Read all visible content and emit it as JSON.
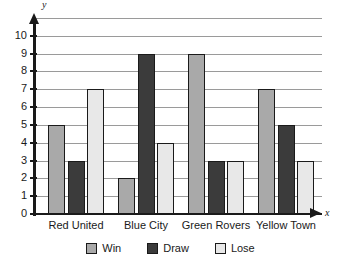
{
  "chart_data": {
    "type": "bar",
    "title": "",
    "xlabel": "x",
    "ylabel": "y",
    "categories": [
      "Red United",
      "Blue City",
      "Green Rovers",
      "Yellow Town"
    ],
    "series": [
      {
        "name": "Win",
        "color": "#a9a9a9",
        "values": [
          5,
          2,
          9,
          7
        ]
      },
      {
        "name": "Draw",
        "color": "#3b3b3b",
        "values": [
          3,
          9,
          3,
          5
        ]
      },
      {
        "name": "Lose",
        "color": "#e8e8e8",
        "values": [
          7,
          4,
          3,
          3
        ]
      }
    ],
    "ylim": [
      0,
      11
    ],
    "ytick_labels": [
      "0",
      "1",
      "2",
      "3",
      "4",
      "5",
      "6",
      "7",
      "8",
      "9",
      "10"
    ],
    "ytick_values": [
      0,
      1,
      2,
      3,
      4,
      5,
      6,
      7,
      8,
      9,
      10
    ],
    "gridlines": [
      1,
      2,
      3,
      4,
      5,
      6,
      7,
      8,
      9,
      10,
      11
    ],
    "grid": true,
    "legend_position": "bottom",
    "axis_arrows": true
  }
}
